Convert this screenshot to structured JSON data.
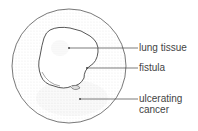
{
  "diagram": {
    "labels": [
      {
        "id": "lung-tissue",
        "text": "lung tissue"
      },
      {
        "id": "fistula",
        "text": "fistula"
      },
      {
        "id": "ulcerating-cancer",
        "line1": "ulcerating",
        "line2": "cancer"
      }
    ],
    "colors": {
      "stroke": "#555555",
      "stipple": "#bbbbbb",
      "text": "#444444"
    }
  }
}
